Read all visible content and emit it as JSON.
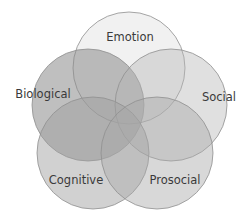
{
  "diagram": {
    "type": "venn",
    "sets": [
      {
        "id": "emotion",
        "label": "Emotion",
        "cx": 129,
        "cy": 68,
        "r": 56,
        "fill": "#bdbdbd",
        "opacity": 0.22,
        "label_x": 130,
        "label_y": 41
      },
      {
        "id": "biological",
        "label": "Biological",
        "cx": 88,
        "cy": 105,
        "r": 56,
        "fill": "#8a8a8a",
        "opacity": 0.55,
        "label_x": 43,
        "label_y": 98
      },
      {
        "id": "social",
        "label": "Social",
        "cx": 171,
        "cy": 105,
        "r": 56,
        "fill": "#b5b5b5",
        "opacity": 0.42,
        "label_x": 219,
        "label_y": 101
      },
      {
        "id": "cognitive",
        "label": "Cognitive",
        "cx": 93,
        "cy": 153,
        "r": 56,
        "fill": "#9f9f9f",
        "opacity": 0.48,
        "label_x": 76,
        "label_y": 184
      },
      {
        "id": "prosocial",
        "label": "Prosocial",
        "cx": 157,
        "cy": 153,
        "r": 56,
        "fill": "#a8a8a8",
        "opacity": 0.45,
        "label_x": 175,
        "label_y": 184
      }
    ]
  }
}
